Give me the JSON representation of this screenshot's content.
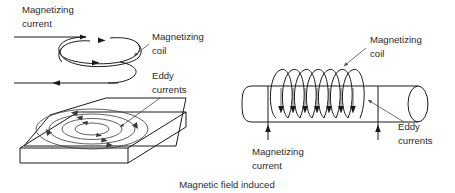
{
  "figure": {
    "caption": "Magnetic field induced",
    "background_color": "#ffffff",
    "line_color": "#1a1a1a",
    "text_color": "#2b2b2b"
  },
  "left_diagram": {
    "name": "flat-plate-eddy-current",
    "labels": {
      "magnetizing_current": {
        "line1": "Magnetizing",
        "line2": "current"
      },
      "magnetizing_coil": {
        "line1": "Magnetizing",
        "line2": "coil"
      },
      "eddy_currents": {
        "line1": "Eddy",
        "line2": "currents"
      }
    },
    "coil_turns": 2,
    "eddy_rings": 4
  },
  "right_diagram": {
    "name": "cylindrical-bar-eddy-current",
    "labels": {
      "magnetizing_coil": {
        "line1": "Magnetizing",
        "line2": "coil"
      },
      "magnetizing_current": {
        "line1": "Magnetizing",
        "line2": "current"
      },
      "eddy_currents": {
        "line1": "Eddy",
        "line2": "currents"
      }
    },
    "coil_turns": 7,
    "flux_arrows": 7
  }
}
